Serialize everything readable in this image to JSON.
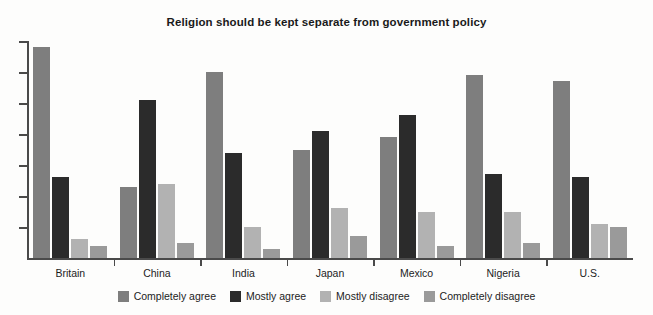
{
  "chart_data": {
    "type": "bar",
    "title": "Religion should be kept separate from government policy",
    "xlabel": "",
    "ylabel": "",
    "ylim": [
      0,
      70
    ],
    "grid": false,
    "legend_position": "bottom",
    "categories": [
      "Britain",
      "China",
      "India",
      "Japan",
      "Mexico",
      "Nigeria",
      "U.S."
    ],
    "series": [
      {
        "name": "Completely agree",
        "color": "#7e7e7e",
        "values": [
          68,
          23,
          60,
          35,
          39,
          59,
          57
        ]
      },
      {
        "name": "Mostly agree",
        "color": "#2b2b2b",
        "values": [
          26,
          51,
          34,
          41,
          46,
          27,
          26
        ]
      },
      {
        "name": "Mostly disagree",
        "color": "#b2b2b2",
        "values": [
          6,
          24,
          10,
          16,
          15,
          15,
          11
        ]
      },
      {
        "name": "Completely disagree",
        "color": "#9a9a9a",
        "values": [
          4,
          5,
          3,
          7,
          4,
          5,
          10
        ]
      }
    ],
    "y_ticks": [
      0,
      10,
      20,
      30,
      40,
      50,
      60,
      70
    ],
    "y_tick_labels_visible": false
  },
  "axis": {
    "line_color": "#4a4a4a"
  },
  "background": {
    "color": "#fdfdfc"
  }
}
